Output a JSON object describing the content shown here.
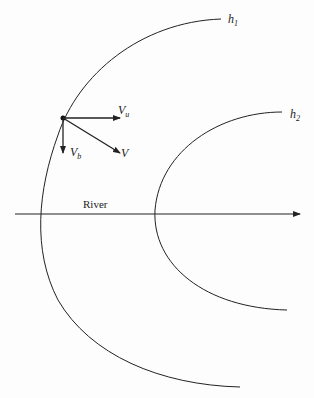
{
  "diagram": {
    "curves": [
      {
        "id": "h1",
        "label": "h",
        "subscript": "1"
      },
      {
        "id": "h2",
        "label": "h",
        "subscript": "2"
      }
    ],
    "vectors": [
      {
        "id": "Vu",
        "label": "V",
        "subscript": "u"
      },
      {
        "id": "Vb",
        "label": "V",
        "subscript": "b"
      },
      {
        "id": "V",
        "label": "V",
        "subscript": ""
      }
    ],
    "river_label": "River",
    "colors": {
      "line": "#222222",
      "background": "#fdfdfd"
    }
  }
}
